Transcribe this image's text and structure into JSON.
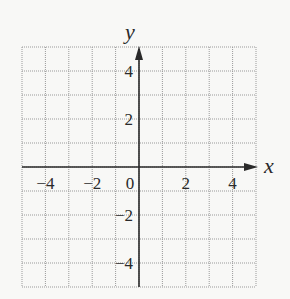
{
  "chart_data": {
    "type": "scatter",
    "title": "",
    "xlabel": "x",
    "ylabel": "y",
    "xlim": [
      -5,
      5
    ],
    "ylim": [
      -5,
      5
    ],
    "grid": true,
    "grid_style": "dotted",
    "grid_step": 1,
    "x_ticks": [
      -4,
      -2,
      0,
      2,
      4
    ],
    "y_ticks": [
      -4,
      -2,
      2,
      4
    ],
    "x_tick_labels": [
      "−4",
      "−2",
      "0",
      "2",
      "4"
    ],
    "y_tick_labels": [
      "−4",
      "−2",
      "2",
      "4"
    ],
    "series": [],
    "legend": null
  },
  "colors": {
    "background": "#f8f8f6",
    "grid": "#9a9a9a",
    "axis": "#2a2a2a",
    "text": "#2a2a2a"
  }
}
